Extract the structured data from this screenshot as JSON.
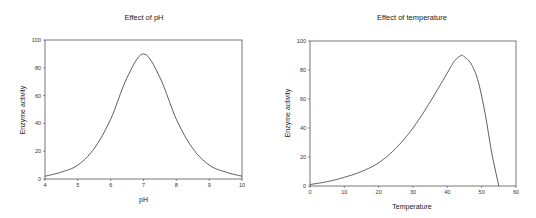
{
  "chart_data": [
    {
      "type": "line",
      "title": "Effect of pH",
      "xlabel": "pH",
      "ylabel": "Enzyme activity",
      "xlim": [
        4,
        10
      ],
      "ylim": [
        0,
        100
      ],
      "xticks": [
        4,
        5,
        6,
        7,
        8,
        9,
        10
      ],
      "yticks": [
        0,
        20,
        40,
        60,
        80,
        100
      ],
      "grid": false,
      "legend": null,
      "series": [
        {
          "name": "Enzyme activity",
          "x": [
            4,
            4.5,
            5,
            5.5,
            6,
            6.5,
            7,
            7.5,
            8,
            8.5,
            9,
            9.5,
            10
          ],
          "y": [
            2,
            5,
            10,
            22,
            43,
            73,
            90,
            73,
            43,
            22,
            10,
            5,
            2
          ]
        }
      ]
    },
    {
      "type": "line",
      "title": "Effect of temperature",
      "xlabel": "Temperature",
      "ylabel": "Enzyme activity",
      "xlim": [
        0,
        60
      ],
      "ylim": [
        0,
        100
      ],
      "xticks": [
        0,
        10,
        20,
        30,
        40,
        50,
        60
      ],
      "yticks": [
        0,
        20,
        40,
        60,
        80,
        100
      ],
      "grid": false,
      "legend": null,
      "series": [
        {
          "name": "Enzyme activity",
          "x": [
            0,
            5,
            10,
            15,
            20,
            25,
            30,
            35,
            40,
            42,
            44,
            45,
            47,
            49,
            51,
            53,
            55
          ],
          "y": [
            1,
            3,
            6,
            10,
            16,
            26,
            40,
            58,
            78,
            86,
            90,
            89,
            84,
            72,
            50,
            22,
            0
          ]
        }
      ]
    }
  ]
}
